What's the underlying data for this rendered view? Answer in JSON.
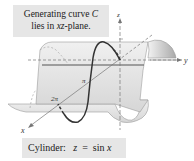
{
  "callout": {
    "line1_prefix": "Generating curve ",
    "line1_var": "C",
    "line2_prefix": "lies in ",
    "line2_var": "xz",
    "line2_suffix": "-plane."
  },
  "caption": {
    "label": "Cylinder:",
    "equation_lhs": "z",
    "equation_eq": "=",
    "equation_rhs_fn": "sin",
    "equation_rhs_var": "x"
  },
  "axes": {
    "x_label": "x",
    "y_label": "y",
    "z_label": "z"
  },
  "ticks": {
    "pi": "π",
    "two_pi": "2π"
  },
  "colors": {
    "surface": "#e4e4e4",
    "surface_shade": "#bdbdbd",
    "curve": "#333333",
    "axis": "#777777",
    "box": "#e6e6e6"
  }
}
